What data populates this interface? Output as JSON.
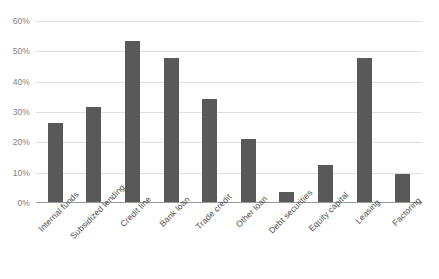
{
  "chart_data": {
    "type": "bar",
    "title": "",
    "subtitle": "",
    "xlabel": "",
    "ylabel": "",
    "ylim": [
      0,
      60
    ],
    "grid": true,
    "legend": false,
    "y_ticks": [
      "0%",
      "10%",
      "20%",
      "30%",
      "40%",
      "50%",
      "60%"
    ],
    "y_tick_values": [
      0,
      10,
      20,
      30,
      40,
      50,
      60
    ],
    "categories": [
      "Internal funds",
      "Subsidized lending",
      "Credit line",
      "Bank loan",
      "Trade credit",
      "Other loan",
      "Debt securities",
      "Equity capital",
      "Leasing",
      "Factoring"
    ],
    "values": [
      26.4,
      31.7,
      53.5,
      47.8,
      34.3,
      21.1,
      3.6,
      12.5,
      47.8,
      9.6
    ],
    "series": [
      {
        "name": "Share of firms",
        "values": [
          26.4,
          31.7,
          53.5,
          47.8,
          34.3,
          21.1,
          3.6,
          12.5,
          47.8,
          9.6
        ]
      }
    ],
    "colors": {
      "bar": "#595959",
      "gridline": "#e0e0e0",
      "axis": "#9a9a9a",
      "tick_label": "#7f7f7f",
      "category_label": "#4d4d4d",
      "background": "#ffffff"
    }
  }
}
